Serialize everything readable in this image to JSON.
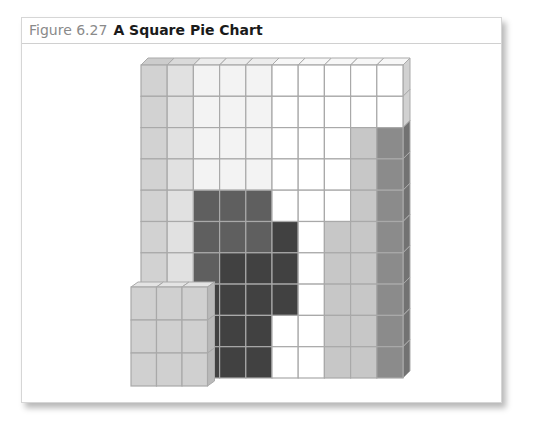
{
  "figure": {
    "number": "Figure 6.27",
    "title": "A Square Pie Chart"
  },
  "chart_data": {
    "type": "square-pie (waffle) chart, 3D block style",
    "title": "A Square Pie Chart",
    "xlabel": "",
    "ylabel": "",
    "grid": {
      "rows": 10,
      "cols": 10,
      "total_cells": 100
    },
    "legend": null,
    "palette": {
      "A": "#d2d2d2",
      "B": "#e1e1e1",
      "C": "#f3f3f3",
      "W": "#ffffff",
      "D1": "#5f5f5f",
      "D2": "#414141",
      "L": "#c7c7c7",
      "M": "#8b8b8b"
    },
    "cells_rows_top_to_bottom": [
      [
        "A",
        "B",
        "C",
        "C",
        "C",
        "W",
        "W",
        "W",
        "W",
        "W"
      ],
      [
        "A",
        "B",
        "C",
        "C",
        "C",
        "W",
        "W",
        "W",
        "W",
        "W"
      ],
      [
        "A",
        "B",
        "C",
        "C",
        "C",
        "W",
        "W",
        "W",
        "L",
        "M"
      ],
      [
        "A",
        "B",
        "C",
        "C",
        "C",
        "W",
        "W",
        "W",
        "L",
        "M"
      ],
      [
        "A",
        "B",
        "D1",
        "D1",
        "D1",
        "W",
        "W",
        "W",
        "L",
        "M"
      ],
      [
        "A",
        "B",
        "D1",
        "D1",
        "D1",
        "D2",
        "W",
        "L",
        "L",
        "M"
      ],
      [
        "A",
        "B",
        "D1",
        "D2",
        "D2",
        "D2",
        "W",
        "L",
        "L",
        "M"
      ],
      [
        "A",
        "B",
        "D2",
        "D2",
        "D2",
        "D2",
        "W",
        "L",
        "L",
        "M"
      ],
      [
        "A",
        "B",
        "D2",
        "D2",
        "D2",
        "W",
        "W",
        "L",
        "L",
        "M"
      ],
      [
        "A",
        "B",
        "D2",
        "D2",
        "D2",
        "W",
        "W",
        "L",
        "L",
        "M"
      ]
    ],
    "inset_block": {
      "rows": 3,
      "cols": 3,
      "cells": 9,
      "color": "#d0d0d0",
      "position": "bottom-left, in front of grid"
    },
    "series": [
      {
        "name": "A (column 1, light gray)",
        "color": "#d2d2d2",
        "value": 10
      },
      {
        "name": "B (column 2, lighter gray)",
        "color": "#e1e1e1",
        "value": 10
      },
      {
        "name": "C (very light gray)",
        "color": "#f3f3f3",
        "value": 12
      },
      {
        "name": "D1 (dark gray)",
        "color": "#5f5f5f",
        "value": 7
      },
      {
        "name": "D2 (darkest gray)",
        "color": "#414141",
        "value": 12
      },
      {
        "name": "W (white)",
        "color": "#ffffff",
        "value": 23
      },
      {
        "name": "L (light gray)",
        "color": "#c7c7c7",
        "value": 18
      },
      {
        "name": "M (medium gray)",
        "color": "#8b8b8b",
        "value": 8
      }
    ]
  }
}
